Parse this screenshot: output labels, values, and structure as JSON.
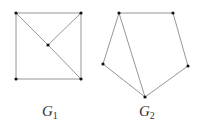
{
  "graphs": [
    {
      "name": "G1",
      "label": "G",
      "subscript": "1",
      "vertices": [
        {
          "id": "a",
          "x": 16,
          "y": 13
        },
        {
          "id": "b",
          "x": 81,
          "y": 13
        },
        {
          "id": "c",
          "x": 48,
          "y": 45
        },
        {
          "id": "d",
          "x": 16,
          "y": 79
        },
        {
          "id": "e",
          "x": 81,
          "y": 79
        }
      ],
      "edges": [
        [
          "a",
          "b"
        ],
        [
          "a",
          "d"
        ],
        [
          "d",
          "e"
        ],
        [
          "b",
          "e"
        ],
        [
          "a",
          "c"
        ],
        [
          "c",
          "e"
        ],
        [
          "b",
          "c"
        ]
      ]
    },
    {
      "name": "G2",
      "label": "G",
      "subscript": "2",
      "vertices": [
        {
          "id": "p",
          "x": 119,
          "y": 13
        },
        {
          "id": "q",
          "x": 173,
          "y": 13
        },
        {
          "id": "r",
          "x": 103,
          "y": 64
        },
        {
          "id": "s",
          "x": 188,
          "y": 66
        },
        {
          "id": "t",
          "x": 145,
          "y": 97
        }
      ],
      "edges": [
        [
          "p",
          "q"
        ],
        [
          "q",
          "s"
        ],
        [
          "s",
          "t"
        ],
        [
          "t",
          "r"
        ],
        [
          "r",
          "p"
        ],
        [
          "p",
          "t"
        ]
      ]
    }
  ],
  "colors": {
    "edge": "#8a8a8a",
    "vertex": "#111111",
    "label": "#333333"
  }
}
